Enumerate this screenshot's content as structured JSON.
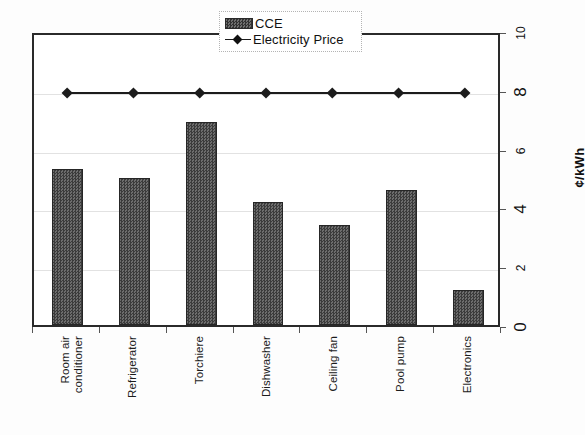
{
  "legend": {
    "position": "top-center",
    "entries": [
      {
        "label": "CCE",
        "marker": "bar-swatch-icon"
      },
      {
        "label": "Electricity Price",
        "marker": "line-diamond-icon"
      }
    ]
  },
  "axes": {
    "y_title": "¢/kWh",
    "y_ticks": [
      "0",
      "2",
      "4",
      "6",
      "8",
      "10"
    ],
    "y_side": "right",
    "y_min": 0,
    "y_max": 10,
    "grid": true
  },
  "chart_data": {
    "type": "bar",
    "title": "",
    "subtitle": "",
    "xlabel": "",
    "ylabel": "¢/kWh",
    "ylim": [
      0,
      10
    ],
    "yticks": [
      0,
      2,
      4,
      6,
      8,
      10
    ],
    "grid": true,
    "legend_position": "top-center",
    "categories": [
      "Room air\nconditioner",
      "Refrigerator",
      "Torchiere",
      "Dishwasher",
      "Ceiling fan",
      "Pool pump",
      "Electronics"
    ],
    "series": [
      {
        "name": "CCE",
        "type": "bar",
        "color": "#4a4a4a",
        "values": [
          5.3,
          5.0,
          6.9,
          4.2,
          3.4,
          4.6,
          1.2
        ]
      },
      {
        "name": "Electricity Price",
        "type": "line",
        "color": "#1c1c1c",
        "marker": "diamond",
        "values": [
          8.0,
          8.0,
          8.0,
          8.0,
          8.0,
          8.0,
          8.0
        ]
      }
    ],
    "annotations": []
  }
}
